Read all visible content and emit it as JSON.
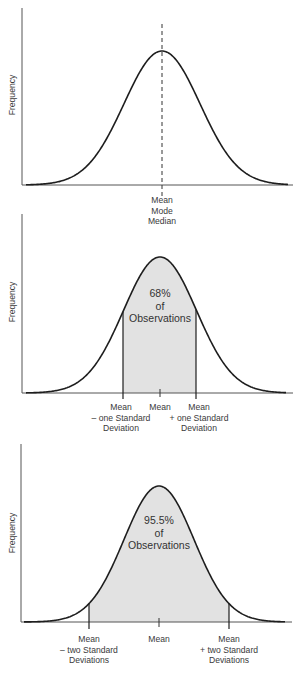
{
  "colors": {
    "line": "#1e1e1e",
    "axis": "#555555",
    "fill": "#e2e2e2",
    "text": "#3a3a3a"
  },
  "chart_data": [
    {
      "type": "line",
      "title": "Normal distribution: Mean, Mode, Median coincide",
      "ylabel": "Frequency",
      "xlabel": "",
      "x_labels": [
        {
          "position": "mean",
          "lines": [
            "Mean",
            "Mode",
            "Median"
          ]
        }
      ],
      "annotations": [
        {
          "type": "dashed-vertical",
          "at": "mean"
        }
      ],
      "grid": false
    },
    {
      "type": "area",
      "title": "68% of observations within one standard deviation",
      "ylabel": "Frequency",
      "shaded_range_sd": [
        -1,
        1
      ],
      "shaded_percent": 68,
      "inside_text": [
        "68%",
        "of",
        "Observations"
      ],
      "x_labels": [
        {
          "position": "mean-1sd",
          "lines": [
            "Mean",
            "– one Standard",
            "Deviation"
          ]
        },
        {
          "position": "mean",
          "lines": [
            "Mean"
          ]
        },
        {
          "position": "mean+1sd",
          "lines": [
            "Mean",
            "+ one Standard",
            "Deviation"
          ]
        }
      ],
      "grid": false
    },
    {
      "type": "area",
      "title": "95.5% of observations within two standard deviations",
      "ylabel": "Frequency",
      "shaded_range_sd": [
        -2,
        2
      ],
      "shaded_percent": 95.5,
      "inside_text": [
        "95.5%",
        "of",
        "Observations"
      ],
      "x_labels": [
        {
          "position": "mean-2sd",
          "lines": [
            "Mean",
            "– two Standard",
            "Deviations"
          ]
        },
        {
          "position": "mean",
          "lines": [
            "Mean"
          ]
        },
        {
          "position": "mean+2sd",
          "lines": [
            "Mean",
            "+ two Standard",
            "Deviations"
          ]
        }
      ],
      "grid": false
    }
  ],
  "charts": [
    {
      "ylabel": "Frequency",
      "labels": {
        "mean": {
          "l1": "Mean",
          "l2": "Mode",
          "l3": "Median"
        }
      }
    },
    {
      "ylabel": "Frequency",
      "inside": {
        "l1": "68%",
        "l2": "of",
        "l3": "Observations"
      },
      "labels": {
        "left": {
          "l1": "Mean",
          "l2": "– one Standard",
          "l3": "Deviation"
        },
        "mean": {
          "l1": "Mean"
        },
        "right": {
          "l1": "Mean",
          "l2": "+ one Standard",
          "l3": "Deviation"
        }
      }
    },
    {
      "ylabel": "Frequency",
      "inside": {
        "l1": "95.5%",
        "l2": "of",
        "l3": "Observations"
      },
      "labels": {
        "left": {
          "l1": "Mean",
          "l2": "– two Standard",
          "l3": "Deviations"
        },
        "mean": {
          "l1": "Mean"
        },
        "right": {
          "l1": "Mean",
          "l2": "+ two Standard",
          "l3": "Deviations"
        }
      }
    }
  ]
}
